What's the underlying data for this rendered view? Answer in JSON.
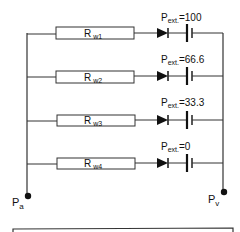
{
  "diagram": {
    "title": "",
    "branches": [
      {
        "resistor_main": "R",
        "resistor_sub": "w1",
        "pext_main": "P",
        "pext_sub": "ext.",
        "pext_value": "=100"
      },
      {
        "resistor_main": "R",
        "resistor_sub": "w2",
        "pext_main": "P",
        "pext_sub": "ext.",
        "pext_value": "=66.6"
      },
      {
        "resistor_main": "R",
        "resistor_sub": "w3",
        "pext_main": "P",
        "pext_sub": "ext.",
        "pext_value": "=33.3"
      },
      {
        "resistor_main": "R",
        "resistor_sub": "w4",
        "pext_main": "P",
        "pext_sub": "ext.",
        "pext_value": "=0"
      }
    ],
    "node_left": {
      "main": "P",
      "sub": "a"
    },
    "node_right": {
      "main": "P",
      "sub": "v"
    },
    "colors": {
      "line": "#333333",
      "fill": "#111111",
      "background": "#ffffff"
    }
  }
}
